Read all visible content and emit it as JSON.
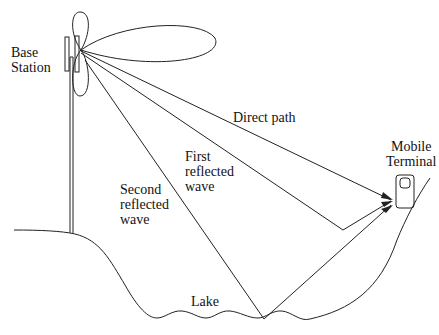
{
  "labels": {
    "base_station": "Base\nStation",
    "direct_path": "Direct path",
    "first_reflected": "First\nreflected\nwave",
    "second_reflected": "Second\nreflected\nwave",
    "mobile_terminal": "Mobile\nTerminal",
    "lake": "Lake"
  },
  "colors": {
    "stroke": "#222222",
    "background": "#ffffff"
  }
}
